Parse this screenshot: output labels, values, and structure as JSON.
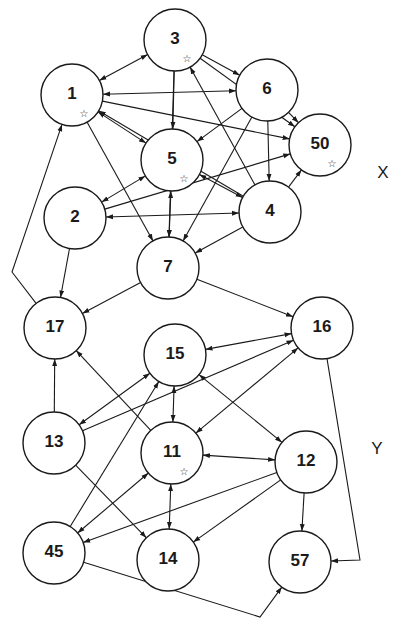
{
  "diagram": {
    "type": "directed-graph",
    "groups": [
      {
        "label": "X",
        "x": 383,
        "y": 172
      },
      {
        "label": "Y",
        "x": 377,
        "y": 448
      }
    ],
    "nodes": [
      {
        "id": "3",
        "label": "3",
        "x": 175,
        "y": 40,
        "star": true
      },
      {
        "id": "1",
        "label": "1",
        "x": 72,
        "y": 95,
        "star": true
      },
      {
        "id": "6",
        "label": "6",
        "x": 267,
        "y": 90,
        "star": false
      },
      {
        "id": "50",
        "label": "50",
        "x": 320,
        "y": 145,
        "star": true
      },
      {
        "id": "5",
        "label": "5",
        "x": 172,
        "y": 160,
        "star": true
      },
      {
        "id": "2",
        "label": "2",
        "x": 75,
        "y": 218,
        "star": false
      },
      {
        "id": "4",
        "label": "4",
        "x": 270,
        "y": 212,
        "star": false
      },
      {
        "id": "7",
        "label": "7",
        "x": 168,
        "y": 268,
        "star": false
      },
      {
        "id": "17",
        "label": "17",
        "x": 55,
        "y": 328,
        "star": false
      },
      {
        "id": "16",
        "label": "16",
        "x": 322,
        "y": 328,
        "star": false
      },
      {
        "id": "15",
        "label": "15",
        "x": 175,
        "y": 355,
        "star": false
      },
      {
        "id": "13",
        "label": "13",
        "x": 54,
        "y": 443,
        "star": false
      },
      {
        "id": "11",
        "label": "11",
        "x": 172,
        "y": 453,
        "star": true
      },
      {
        "id": "12",
        "label": "12",
        "x": 306,
        "y": 462,
        "star": false
      },
      {
        "id": "45",
        "label": "45",
        "x": 54,
        "y": 553,
        "star": false
      },
      {
        "id": "14",
        "label": "14",
        "x": 168,
        "y": 560,
        "star": false
      },
      {
        "id": "57",
        "label": "57",
        "x": 300,
        "y": 562,
        "star": false
      }
    ],
    "node_radius": 31,
    "star_glyph": "☆",
    "edges": [
      {
        "from": "1",
        "to": "3",
        "bidirectional": true
      },
      {
        "from": "1",
        "to": "6",
        "bidirectional": true
      },
      {
        "from": "1",
        "to": "50",
        "bidirectional": false
      },
      {
        "from": "1",
        "to": "5",
        "bidirectional": true
      },
      {
        "from": "1",
        "to": "7",
        "bidirectional": false
      },
      {
        "from": "3",
        "to": "6",
        "bidirectional": false
      },
      {
        "from": "3",
        "to": "5",
        "bidirectional": false
      },
      {
        "from": "3",
        "to": "50",
        "bidirectional": false
      },
      {
        "from": "3",
        "to": "7",
        "bidirectional": false
      },
      {
        "from": "4",
        "to": "3",
        "bidirectional": false
      },
      {
        "from": "6",
        "to": "50",
        "bidirectional": false
      },
      {
        "from": "6",
        "to": "5",
        "bidirectional": false
      },
      {
        "from": "6",
        "to": "4",
        "bidirectional": false
      },
      {
        "from": "6",
        "to": "7",
        "bidirectional": false
      },
      {
        "from": "5",
        "to": "2",
        "bidirectional": true
      },
      {
        "from": "5",
        "to": "4",
        "bidirectional": true
      },
      {
        "from": "5",
        "to": "7",
        "bidirectional": true
      },
      {
        "from": "4",
        "to": "50",
        "bidirectional": false
      },
      {
        "from": "4",
        "to": "1",
        "bidirectional": false
      },
      {
        "from": "4",
        "to": "2",
        "bidirectional": true
      },
      {
        "from": "4",
        "to": "7",
        "bidirectional": false
      },
      {
        "from": "2",
        "to": "50",
        "bidirectional": false
      },
      {
        "from": "2",
        "to": "17",
        "bidirectional": false
      },
      {
        "from": "7",
        "to": "17",
        "bidirectional": false
      },
      {
        "from": "7",
        "to": "16",
        "bidirectional": false
      },
      {
        "from": "17",
        "to": "1",
        "bidirectional": false,
        "via": [
          [
            12,
            272
          ]
        ]
      },
      {
        "from": "16",
        "to": "15",
        "bidirectional": true
      },
      {
        "from": "16",
        "to": "11",
        "bidirectional": true
      },
      {
        "from": "16",
        "to": "57",
        "bidirectional": false,
        "via": [
          [
            360,
            560
          ]
        ]
      },
      {
        "from": "13",
        "to": "16",
        "bidirectional": false
      },
      {
        "from": "13",
        "to": "15",
        "bidirectional": true
      },
      {
        "from": "13",
        "to": "17",
        "bidirectional": false
      },
      {
        "from": "13",
        "to": "14",
        "bidirectional": false
      },
      {
        "from": "11",
        "to": "17",
        "bidirectional": false
      },
      {
        "from": "15",
        "to": "11",
        "bidirectional": true
      },
      {
        "from": "15",
        "to": "12",
        "bidirectional": true
      },
      {
        "from": "11",
        "to": "12",
        "bidirectional": true
      },
      {
        "from": "11",
        "to": "14",
        "bidirectional": true
      },
      {
        "from": "45",
        "to": "15",
        "bidirectional": false
      },
      {
        "from": "45",
        "to": "11",
        "bidirectional": true
      },
      {
        "from": "12",
        "to": "45",
        "bidirectional": false
      },
      {
        "from": "12",
        "to": "14",
        "bidirectional": false
      },
      {
        "from": "12",
        "to": "57",
        "bidirectional": false
      },
      {
        "from": "45",
        "to": "57",
        "bidirectional": false,
        "via": [
          [
            260,
            617
          ]
        ]
      }
    ]
  }
}
